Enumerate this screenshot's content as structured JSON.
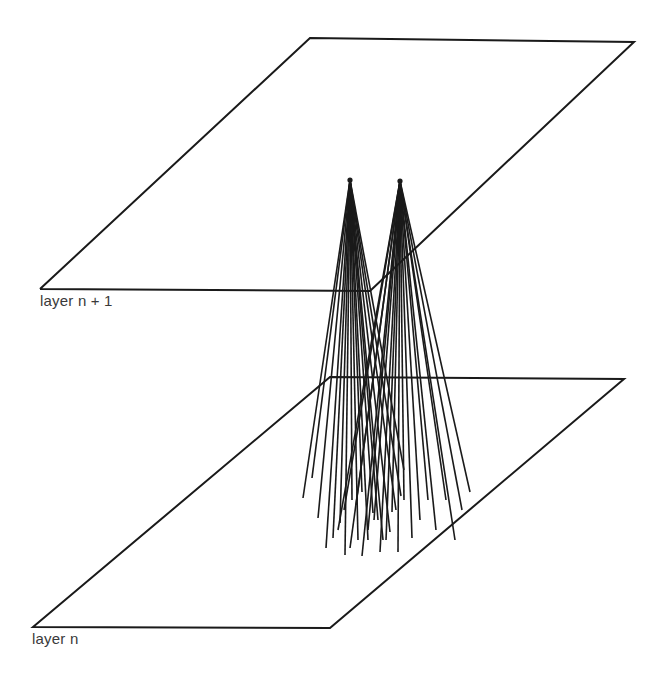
{
  "labels": {
    "upper_layer": "layer n + 1",
    "lower_layer": "layer n"
  },
  "colors": {
    "ink": "#1a1a1a",
    "label": "#3a3a3a",
    "background": "#ffffff"
  },
  "planes": {
    "upper": {
      "points": [
        [
          310,
          38
        ],
        [
          634,
          42
        ],
        [
          370,
          291
        ],
        [
          40,
          289
        ]
      ]
    },
    "lower": {
      "points": [
        [
          330,
          377
        ],
        [
          624,
          379
        ],
        [
          330,
          628
        ],
        [
          33,
          627
        ]
      ]
    }
  },
  "apexes": [
    {
      "name": "neuron-left",
      "x": 350,
      "y": 180
    },
    {
      "name": "neuron-right",
      "x": 400,
      "y": 181
    }
  ],
  "fans": {
    "left": [
      [
        303,
        498
      ],
      [
        312,
        478
      ],
      [
        318,
        518
      ],
      [
        326,
        548
      ],
      [
        333,
        538
      ],
      [
        340,
        523
      ],
      [
        345,
        555
      ],
      [
        352,
        500
      ],
      [
        358,
        540
      ],
      [
        362,
        492
      ],
      [
        368,
        540
      ],
      [
        373,
        513
      ],
      [
        378,
        520
      ],
      [
        383,
        540
      ],
      [
        390,
        532
      ],
      [
        396,
        510
      ],
      [
        401,
        496
      ],
      [
        404,
        470
      ]
    ],
    "right": [
      [
        338,
        530
      ],
      [
        344,
        510
      ],
      [
        350,
        548
      ],
      [
        356,
        505
      ],
      [
        362,
        556
      ],
      [
        368,
        530
      ],
      [
        374,
        520
      ],
      [
        380,
        552
      ],
      [
        386,
        540
      ],
      [
        392,
        512
      ],
      [
        398,
        552
      ],
      [
        404,
        500
      ],
      [
        412,
        538
      ],
      [
        420,
        520
      ],
      [
        428,
        500
      ],
      [
        436,
        530
      ],
      [
        446,
        500
      ],
      [
        455,
        540
      ],
      [
        462,
        510
      ],
      [
        470,
        492
      ]
    ]
  }
}
